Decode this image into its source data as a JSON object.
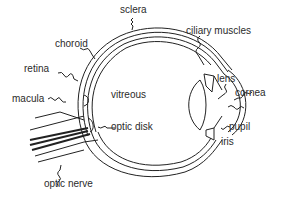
{
  "colors": {
    "line": "#222222",
    "text": "#2b2b2b",
    "background": "#ffffff"
  },
  "labels": {
    "sclera": "sclera",
    "choroid": "choroid",
    "retina": "retina",
    "macula": "macula",
    "vitreous": "vitreous",
    "optic_disk": "optic disk",
    "optic_nerve": "optic nerve",
    "ciliary_muscles": "ciliary muscles",
    "lens": "lens",
    "cornea": "cornea",
    "pupil": "pupil",
    "iris": "iris"
  }
}
